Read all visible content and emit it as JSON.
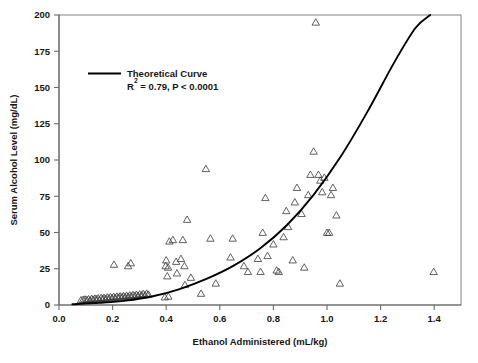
{
  "chart_data": {
    "type": "scatter",
    "title": "",
    "xlabel": "Ethanol Administered (mL/kg)",
    "ylabel": "Serum Alcohol Level (mg/dL)",
    "xlim": [
      0.0,
      1.5
    ],
    "ylim": [
      0,
      200
    ],
    "xticks": [
      0.0,
      0.2,
      0.4,
      0.6,
      0.8,
      1.0,
      1.2,
      1.4
    ],
    "xtick_labels": [
      "0.0",
      "0.2",
      "0.4",
      "0.6",
      "0.8",
      "1.0",
      "1.2",
      "1.4"
    ],
    "yticks": [
      0,
      25,
      50,
      75,
      100,
      125,
      150,
      175,
      200
    ],
    "ytick_labels": [
      "0",
      "25",
      "50",
      "75",
      "100",
      "125",
      "150",
      "175",
      "200"
    ],
    "grid": false,
    "legend_position": "upper-left-inside",
    "marker": "open-triangle",
    "marker_color": "#3a3a3a",
    "curve_color": "#000000",
    "legend": [
      {
        "label": "Theoretical Curve",
        "stats": "R2 = 0.79, P < 0.0001",
        "stats_prefix": "R",
        "stats_sup": "2",
        "stats_rest": " = 0.79, P < 0.0001"
      }
    ],
    "series": [
      {
        "name": "Observed subjects",
        "marker": "open-triangle",
        "points": [
          [
            0.082,
            1.5
          ],
          [
            0.09,
            1.8
          ],
          [
            0.097,
            2.0
          ],
          [
            0.104,
            1.6
          ],
          [
            0.11,
            2.2
          ],
          [
            0.116,
            1.4
          ],
          [
            0.122,
            2.4
          ],
          [
            0.128,
            1.9
          ],
          [
            0.134,
            2.6
          ],
          [
            0.14,
            2.1
          ],
          [
            0.146,
            2.8
          ],
          [
            0.151,
            1.7
          ],
          [
            0.157,
            3.0
          ],
          [
            0.163,
            2.3
          ],
          [
            0.168,
            3.2
          ],
          [
            0.174,
            2.5
          ],
          [
            0.18,
            3.4
          ],
          [
            0.186,
            2.7
          ],
          [
            0.192,
            3.6
          ],
          [
            0.198,
            2.9
          ],
          [
            0.204,
            3.8
          ],
          [
            0.21,
            3.1
          ],
          [
            0.216,
            4.0
          ],
          [
            0.222,
            3.3
          ],
          [
            0.228,
            4.2
          ],
          [
            0.234,
            3.5
          ],
          [
            0.24,
            4.4
          ],
          [
            0.246,
            3.7
          ],
          [
            0.252,
            4.6
          ],
          [
            0.258,
            3.9
          ],
          [
            0.264,
            4.8
          ],
          [
            0.27,
            4.1
          ],
          [
            0.276,
            5.0
          ],
          [
            0.283,
            4.3
          ],
          [
            0.289,
            5.2
          ],
          [
            0.295,
            4.5
          ],
          [
            0.301,
            5.5
          ],
          [
            0.308,
            4.8
          ],
          [
            0.314,
            5.8
          ],
          [
            0.321,
            5.0
          ],
          [
            0.327,
            6.0
          ],
          [
            0.334,
            5.3
          ],
          [
            0.205,
            26.0
          ],
          [
            0.258,
            25.0
          ],
          [
            0.268,
            27.0
          ],
          [
            0.395,
            3.5
          ],
          [
            0.408,
            4.0
          ],
          [
            0.47,
            12.0
          ],
          [
            0.398,
            25.0
          ],
          [
            0.407,
            24.0
          ],
          [
            0.412,
            42.0
          ],
          [
            0.4,
            29.0
          ],
          [
            0.404,
            18.0
          ],
          [
            0.425,
            43.0
          ],
          [
            0.437,
            28.0
          ],
          [
            0.44,
            20.0
          ],
          [
            0.455,
            30.0
          ],
          [
            0.462,
            43.0
          ],
          [
            0.468,
            25.0
          ],
          [
            0.478,
            57.0
          ],
          [
            0.492,
            17.0
          ],
          [
            0.53,
            6.0
          ],
          [
            0.548,
            92.0
          ],
          [
            0.565,
            44.0
          ],
          [
            0.585,
            13.0
          ],
          [
            0.64,
            31.0
          ],
          [
            0.648,
            44.0
          ],
          [
            0.69,
            25.0
          ],
          [
            0.705,
            21.0
          ],
          [
            0.742,
            30.0
          ],
          [
            0.752,
            21.0
          ],
          [
            0.76,
            48.0
          ],
          [
            0.77,
            72.0
          ],
          [
            0.778,
            32.0
          ],
          [
            0.8,
            40.0
          ],
          [
            0.812,
            22.0
          ],
          [
            0.82,
            21.0
          ],
          [
            0.838,
            45.0
          ],
          [
            0.848,
            63.0
          ],
          [
            0.855,
            52.0
          ],
          [
            0.872,
            29.0
          ],
          [
            0.88,
            69.0
          ],
          [
            0.888,
            79.0
          ],
          [
            0.905,
            61.0
          ],
          [
            0.915,
            24.0
          ],
          [
            0.93,
            74.0
          ],
          [
            0.938,
            88.0
          ],
          [
            0.95,
            104.0
          ],
          [
            0.958,
            193.0
          ],
          [
            0.968,
            88.0
          ],
          [
            0.975,
            84.0
          ],
          [
            0.982,
            76.0
          ],
          [
            0.99,
            86.0
          ],
          [
            1.0,
            48.0
          ],
          [
            1.008,
            48.0
          ],
          [
            1.015,
            74.0
          ],
          [
            1.022,
            79.0
          ],
          [
            1.035,
            60.0
          ],
          [
            1.048,
            13.0
          ],
          [
            1.398,
            21.0
          ]
        ]
      }
    ],
    "curve": {
      "name": "Theoretical Curve",
      "description": "Exponential theoretical curve rising from 0 at low dose to 200 mg/dL at 1.40 mL/kg",
      "points": [
        [
          0.05,
          0.5
        ],
        [
          0.15,
          1.5
        ],
        [
          0.25,
          3.0
        ],
        [
          0.35,
          6.0
        ],
        [
          0.45,
          11.0
        ],
        [
          0.55,
          18.0
        ],
        [
          0.65,
          27.0
        ],
        [
          0.75,
          39.0
        ],
        [
          0.85,
          55.0
        ],
        [
          0.95,
          76.0
        ],
        [
          1.05,
          102.0
        ],
        [
          1.15,
          133.0
        ],
        [
          1.25,
          167.0
        ],
        [
          1.33,
          191.0
        ],
        [
          1.385,
          200.0
        ]
      ]
    }
  }
}
